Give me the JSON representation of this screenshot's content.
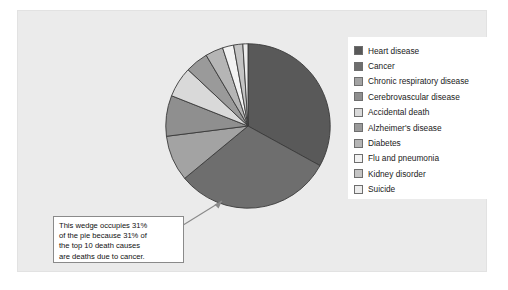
{
  "figure": {
    "background_color": "#ebebeb",
    "frame_color": "#e2e2e2"
  },
  "chart_data": {
    "type": "pie",
    "title": "",
    "categories": [
      "Heart disease",
      "Cancer",
      "Chronic respiratory disease",
      "Cerebrovascular disease",
      "Accidental death",
      "Alzheimer's disease",
      "Diabetes",
      "Flu and pneumonia",
      "Kidney disorder",
      "Suicide"
    ],
    "values": [
      33,
      31,
      9,
      8,
      6,
      4.5,
      3.5,
      2.2,
      1.8,
      1.0
    ],
    "units": "percent of top 10 death causes",
    "start_angle_deg": 0,
    "direction": "clockwise",
    "colors": [
      "#595959",
      "#6e6e6e",
      "#a3a3a3",
      "#8f8f8f",
      "#d9d9d9",
      "#9a9a9a",
      "#b5b5b5",
      "#f2f2f2",
      "#c4c4c4",
      "#ececec"
    ],
    "legend_position": "right",
    "grid": false,
    "annotations": [
      "This wedge occupies 31% of the pie because 31% of the top 10 death causes are deaths due to cancer."
    ]
  },
  "legend": {
    "items": [
      {
        "label": "Heart disease",
        "color": "#595959"
      },
      {
        "label": "Cancer",
        "color": "#6e6e6e"
      },
      {
        "label": "Chronic respiratory disease",
        "color": "#a3a3a3"
      },
      {
        "label": "Cerebrovascular disease",
        "color": "#8f8f8f"
      },
      {
        "label": "Accidental death",
        "color": "#d9d9d9"
      },
      {
        "label": "Alzheimer's disease",
        "color": "#9a9a9a"
      },
      {
        "label": "Diabetes",
        "color": "#b5b5b5"
      },
      {
        "label": "Flu and pneumonia",
        "color": "#f2f2f2"
      },
      {
        "label": "Kidney disorder",
        "color": "#c4c4c4"
      },
      {
        "label": "Suicide",
        "color": "#ececec"
      }
    ]
  },
  "callout": {
    "lines": [
      "This wedge occupies 31%",
      "of the pie because 31% of",
      "the top 10 death causes",
      "are deaths due to cancer."
    ],
    "target_wedge": "Cancer",
    "border_color": "#8a8a8a"
  }
}
